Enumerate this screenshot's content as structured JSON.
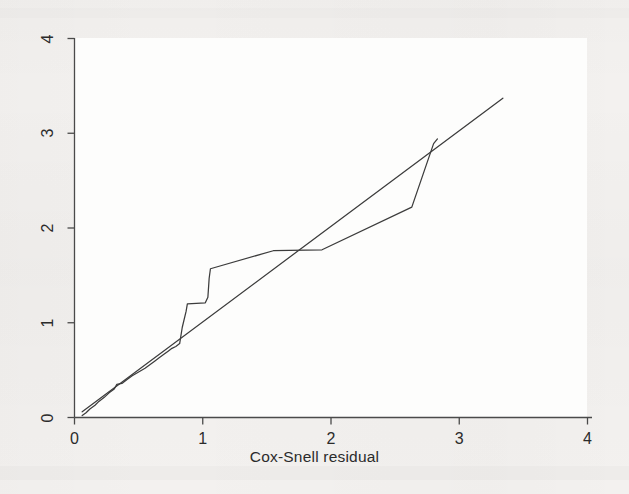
{
  "chart_data": {
    "type": "line",
    "title": "",
    "subtitle": "",
    "xlabel": "Cox-Snell residual",
    "ylabel": "",
    "xlim": [
      0,
      4
    ],
    "ylim": [
      0,
      4
    ],
    "xticks": [
      0,
      1,
      2,
      3,
      4
    ],
    "yticks": [
      0,
      1,
      2,
      3,
      4
    ],
    "xtick_labels": [
      "0",
      "1",
      "2",
      "3",
      "4"
    ],
    "ytick_labels": [
      "0",
      "1",
      "2",
      "3",
      "4"
    ],
    "grid": false,
    "legend": "none",
    "legend_position": "none",
    "annotations": [],
    "series": [
      {
        "name": "Nelson-Aalen cumulative hazard (step)",
        "type": "step-line",
        "color": "#3c3c3c",
        "points": [
          [
            0.06,
            0.02
          ],
          [
            0.09,
            0.05
          ],
          [
            0.12,
            0.09
          ],
          [
            0.16,
            0.13
          ],
          [
            0.19,
            0.17
          ],
          [
            0.23,
            0.21
          ],
          [
            0.27,
            0.26
          ],
          [
            0.31,
            0.3
          ],
          [
            0.33,
            0.35
          ],
          [
            0.37,
            0.36
          ],
          [
            0.41,
            0.4
          ],
          [
            0.45,
            0.44
          ],
          [
            0.5,
            0.48
          ],
          [
            0.55,
            0.52
          ],
          [
            0.59,
            0.56
          ],
          [
            0.63,
            0.6
          ],
          [
            0.66,
            0.63
          ],
          [
            0.7,
            0.67
          ],
          [
            0.73,
            0.7
          ],
          [
            0.76,
            0.73
          ],
          [
            0.79,
            0.75
          ],
          [
            0.82,
            0.78
          ],
          [
            0.84,
            0.95
          ],
          [
            0.87,
            1.12
          ],
          [
            0.88,
            1.2
          ],
          [
            1.02,
            1.21
          ],
          [
            1.04,
            1.27
          ],
          [
            1.05,
            1.47
          ],
          [
            1.06,
            1.57
          ],
          [
            1.55,
            1.76
          ],
          [
            1.93,
            1.77
          ],
          [
            2.63,
            2.22
          ],
          [
            2.8,
            2.89
          ],
          [
            2.83,
            2.94
          ]
        ]
      },
      {
        "name": "Reference line (y = x)",
        "type": "line",
        "color": "#3c3c3c",
        "points": [
          [
            0.06,
            0.06
          ],
          [
            3.34,
            3.37
          ]
        ]
      }
    ]
  },
  "axes": {
    "x_axis_name": "x-axis",
    "y_axis_name": "y-axis",
    "x_title": "Cox-Snell residual"
  }
}
